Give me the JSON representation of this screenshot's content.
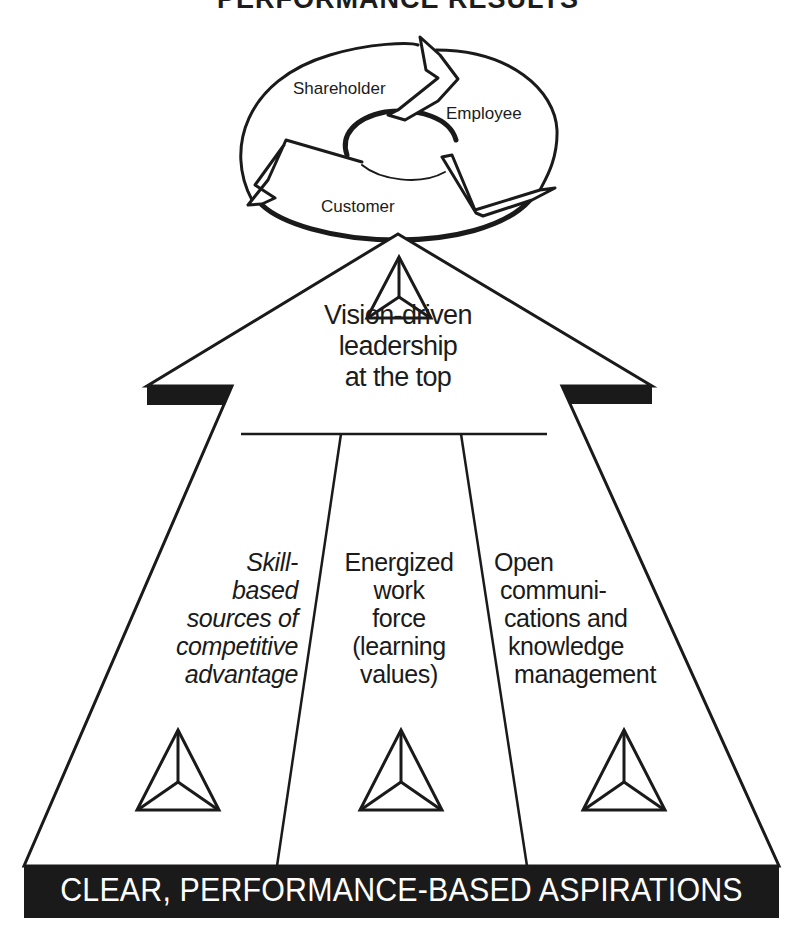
{
  "title": "PERFORMANCE RESULTS",
  "cycle": {
    "items": [
      {
        "label": "Shareholder"
      },
      {
        "label": "Employee"
      },
      {
        "label": "Customer"
      }
    ]
  },
  "apex": {
    "icon": "triangle-pyramid-icon",
    "lines": [
      "Vision-driven",
      "leadership",
      "at the top"
    ]
  },
  "pillars": [
    {
      "lines": [
        "Skill-",
        "based",
        "sources of",
        "competitive",
        "advantage"
      ],
      "style": "italic",
      "icon": "triangle-pyramid-icon"
    },
    {
      "lines": [
        "Energized",
        "work",
        "force",
        "(learning",
        "values)"
      ],
      "style": "normal",
      "icon": "triangle-pyramid-icon"
    },
    {
      "lines": [
        "Open",
        "communi-",
        "cations and",
        "knowledge",
        "management"
      ],
      "style": "normal",
      "icon": "triangle-pyramid-icon"
    }
  ],
  "foundation": {
    "label": "CLEAR, PERFORMANCE-BASED ASPIRATIONS"
  },
  "colors": {
    "ink": "#1a1a1a",
    "background": "#ffffff",
    "banner_text": "#ffffff"
  }
}
